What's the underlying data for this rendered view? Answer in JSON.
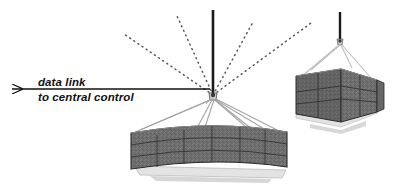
{
  "diagram": {
    "background_color": "#ffffff",
    "annotation": {
      "line1": "data link",
      "line2": "to central control",
      "arrow_direction": "left",
      "arrow_color": "#111111"
    },
    "hub": {
      "name": "central-node",
      "x": 213,
      "y": 96,
      "color": "#3a3a3a"
    },
    "mast": {
      "name": "vertical-mast",
      "color": "#1a1a1a",
      "top_y": 10,
      "bottom_y": 96
    },
    "dotted_links": {
      "count": 4,
      "color": "#555555",
      "style": "dotted",
      "endpoints": [
        {
          "x": 124,
          "y": 34
        },
        {
          "x": 177,
          "y": 16
        },
        {
          "x": 253,
          "y": 22
        },
        {
          "x": 311,
          "y": 23
        }
      ]
    },
    "modules": [
      {
        "name": "large-suspended-array",
        "panel_rows": 3,
        "panel_columns": 6,
        "panel_fill": "#6e6e6e",
        "panel_edge": "#2a2a2a",
        "cable_color": "#9a9a9a",
        "frame_color": "#d8d8d8"
      },
      {
        "name": "small-suspended-array",
        "panel_rows": 3,
        "panel_columns": 4,
        "panel_fill": "#6e6e6e",
        "panel_edge": "#2a2a2a",
        "cable_color": "#b0b0b0",
        "frame_color": "#d8d8d8",
        "mast_color": "#1a1a1a"
      }
    ]
  }
}
